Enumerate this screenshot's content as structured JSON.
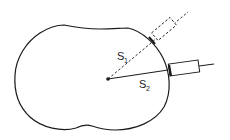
{
  "diagram": {
    "title": "",
    "labels": {
      "s1_main": "S",
      "s1_sub": "1",
      "s2_main": "S",
      "s2_sub": "2"
    },
    "elements": [
      {
        "id": "body-outline",
        "description": "kidney/bean-shaped closed outline"
      },
      {
        "id": "center-point",
        "description": "center dot"
      },
      {
        "id": "path-s1",
        "description": "dashed line from center to first probe position",
        "label": "S1",
        "style": "dashed"
      },
      {
        "id": "path-s2",
        "description": "solid line from center to second probe position",
        "label": "S2",
        "style": "solid"
      },
      {
        "id": "probe-1",
        "description": "dashed rectangular probe (alternate position)",
        "style": "dashed"
      },
      {
        "id": "probe-2",
        "description": "solid rectangular probe with cable",
        "style": "solid"
      }
    ],
    "colors": {
      "stroke": "#1a1a1a",
      "background": "#ffffff"
    }
  }
}
